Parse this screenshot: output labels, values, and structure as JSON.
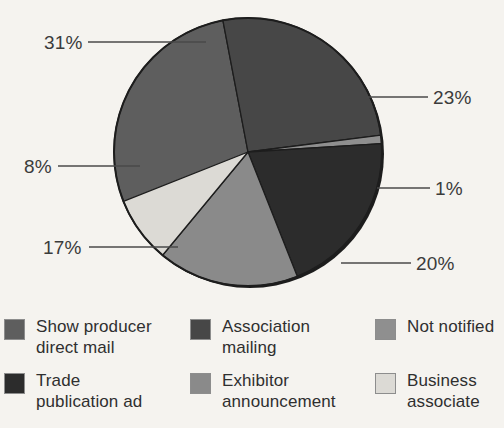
{
  "chart_data": {
    "type": "pie",
    "title": "",
    "categories": [
      "Show producer direct mail",
      "Association mailing",
      "Not notified",
      "Trade publication ad",
      "Exhibitor announcement",
      "Business associate"
    ],
    "values": [
      31,
      23,
      1,
      20,
      17,
      8
    ],
    "labels": [
      "31%",
      "23%",
      "1%",
      "20%",
      "17%",
      "8%"
    ],
    "unit": "percent",
    "legend_position": "bottom",
    "grid": false,
    "slices": [
      {
        "label": "31%",
        "value": 31,
        "category": "Show producer direct mail",
        "color": "#5e5e5e",
        "start_deg": 237.6,
        "end_deg": 349.2
      },
      {
        "label": "23%",
        "value": 23,
        "category": "Association mailing",
        "color": "#474747",
        "start_deg": 349.2,
        "end_deg": 82.8
      },
      {
        "label": "1%",
        "value": 1,
        "category": "Not notified",
        "color": "#8f8f8f",
        "start_deg": 82.8,
        "end_deg": 86.4
      },
      {
        "label": "20%",
        "value": 20,
        "category": "Trade publication ad",
        "color": "#2c2c2c",
        "start_deg": 86.4,
        "end_deg": 158.4
      },
      {
        "label": "17%",
        "value": 17,
        "category": "Exhibitor announcement",
        "color": "#8a8a8a",
        "start_deg": 158.4,
        "end_deg": 219.6
      },
      {
        "label": "8%",
        "value": 8,
        "category": "Business associate",
        "color": "#dcdad5",
        "start_deg": 219.6,
        "end_deg": 248.4
      }
    ]
  },
  "legend": {
    "items": [
      {
        "label": "Show producer\ndirect mail",
        "color": "#5e5e5e"
      },
      {
        "label": "Association\nmailing",
        "color": "#474747"
      },
      {
        "label": "Not notified",
        "color": "#8f8f8f"
      },
      {
        "label": "Trade\npublication ad",
        "color": "#2c2c2c"
      },
      {
        "label": "Exhibitor\nannouncement",
        "color": "#8a8a8a"
      },
      {
        "label": "Business\nassociate",
        "color": "#dcdad5"
      }
    ]
  },
  "colors": {
    "background": "#f5f3ef",
    "text": "#2f2f2f",
    "leader_line": "#4a4a4a",
    "slice_outline": "#1d1d1d"
  }
}
